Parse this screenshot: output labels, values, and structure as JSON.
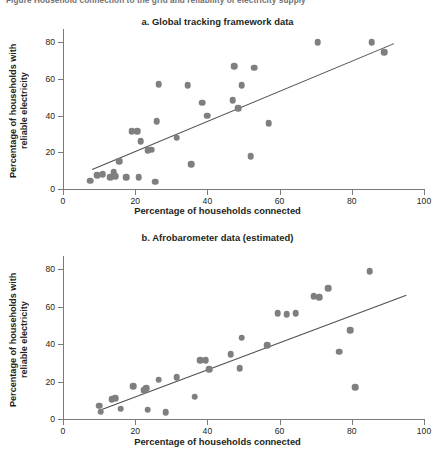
{
  "header": {
    "caption": "Figure   Household connection to the grid and reliability of electricity supply"
  },
  "chart_data": [
    {
      "type": "scatter",
      "title": "a. Global tracking framework data",
      "xlabel": "Percentage of households connected",
      "ylabel": "Percentage of households with\nreliable electricity",
      "xlim": [
        0,
        100
      ],
      "ylim": [
        0,
        85
      ],
      "xticks": [
        0,
        20,
        40,
        60,
        80,
        100
      ],
      "yticks": [
        0,
        20,
        40,
        60,
        80
      ],
      "grid": false,
      "legend": "none",
      "marker_color": "#7f7f82",
      "trendline_color": "#4d4d51",
      "points": [
        {
          "x": 7.5,
          "y": 4.5
        },
        {
          "x": 9.5,
          "y": 7.5
        },
        {
          "x": 11.0,
          "y": 8.0
        },
        {
          "x": 13.0,
          "y": 6.5
        },
        {
          "x": 14.0,
          "y": 9.0
        },
        {
          "x": 14.5,
          "y": 7.0
        },
        {
          "x": 15.5,
          "y": 15.0
        },
        {
          "x": 17.5,
          "y": 6.5
        },
        {
          "x": 19.0,
          "y": 31.5
        },
        {
          "x": 20.5,
          "y": 31.5
        },
        {
          "x": 21.0,
          "y": 6.5
        },
        {
          "x": 21.5,
          "y": 26.0
        },
        {
          "x": 23.5,
          "y": 21.0
        },
        {
          "x": 24.5,
          "y": 21.5
        },
        {
          "x": 25.5,
          "y": 4.0
        },
        {
          "x": 26.0,
          "y": 37.0
        },
        {
          "x": 26.5,
          "y": 57.0
        },
        {
          "x": 31.5,
          "y": 28.0
        },
        {
          "x": 34.5,
          "y": 56.5
        },
        {
          "x": 35.5,
          "y": 13.5
        },
        {
          "x": 38.5,
          "y": 47.0
        },
        {
          "x": 40.0,
          "y": 40.0
        },
        {
          "x": 47.0,
          "y": 48.5
        },
        {
          "x": 47.5,
          "y": 67.0
        },
        {
          "x": 48.5,
          "y": 44.0
        },
        {
          "x": 49.5,
          "y": 56.5
        },
        {
          "x": 52.0,
          "y": 18.0
        },
        {
          "x": 53.0,
          "y": 66.0
        },
        {
          "x": 57.0,
          "y": 36.0
        },
        {
          "x": 70.5,
          "y": 80.0
        },
        {
          "x": 85.5,
          "y": 80.0
        },
        {
          "x": 89.0,
          "y": 74.5
        }
      ],
      "trendline": {
        "x1": 8.0,
        "y1": 11.0,
        "x2": 91.5,
        "y2": 79.5
      }
    },
    {
      "type": "scatter",
      "title": "b. Afrobarometer data (estimated)",
      "xlabel": "Percentage of households connected",
      "ylabel": "Percentage of households with\nreliable electricity",
      "xlim": [
        0,
        100
      ],
      "ylim": [
        0,
        85
      ],
      "xticks": [
        0,
        20,
        40,
        60,
        80,
        100
      ],
      "yticks": [
        0,
        20,
        40,
        60,
        80
      ],
      "grid": false,
      "legend": "none",
      "marker_color": "#7f7f82",
      "trendline_color": "#4d4d51",
      "points": [
        {
          "x": 10.0,
          "y": 7.0
        },
        {
          "x": 10.5,
          "y": 4.0
        },
        {
          "x": 13.5,
          "y": 10.5
        },
        {
          "x": 14.5,
          "y": 11.0
        },
        {
          "x": 16.0,
          "y": 5.5
        },
        {
          "x": 19.5,
          "y": 17.5
        },
        {
          "x": 22.5,
          "y": 15.5
        },
        {
          "x": 23.0,
          "y": 16.5
        },
        {
          "x": 23.5,
          "y": 5.0
        },
        {
          "x": 26.5,
          "y": 21.0
        },
        {
          "x": 28.5,
          "y": 3.5
        },
        {
          "x": 31.5,
          "y": 22.5
        },
        {
          "x": 36.5,
          "y": 12.0
        },
        {
          "x": 38.0,
          "y": 31.5
        },
        {
          "x": 39.5,
          "y": 31.5
        },
        {
          "x": 40.5,
          "y": 26.5
        },
        {
          "x": 46.5,
          "y": 34.5
        },
        {
          "x": 49.0,
          "y": 27.0
        },
        {
          "x": 49.5,
          "y": 43.5
        },
        {
          "x": 56.5,
          "y": 39.5
        },
        {
          "x": 59.5,
          "y": 56.5
        },
        {
          "x": 62.0,
          "y": 56.0
        },
        {
          "x": 64.5,
          "y": 56.5
        },
        {
          "x": 69.5,
          "y": 65.5
        },
        {
          "x": 71.0,
          "y": 65.0
        },
        {
          "x": 73.5,
          "y": 70.0
        },
        {
          "x": 76.5,
          "y": 36.0
        },
        {
          "x": 79.5,
          "y": 47.5
        },
        {
          "x": 81.0,
          "y": 17.0
        },
        {
          "x": 85.0,
          "y": 79.0
        }
      ],
      "trendline": {
        "x1": 10.0,
        "y1": 5.0,
        "x2": 95.0,
        "y2": 66.5
      }
    }
  ]
}
